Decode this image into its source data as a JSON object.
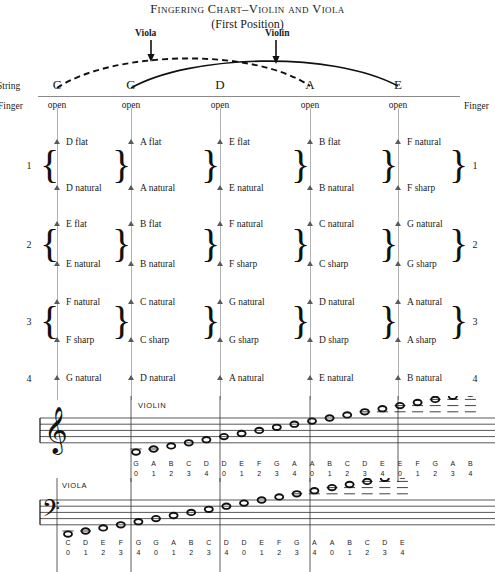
{
  "title": {
    "main": "Fingering Chart–Violin and Viola",
    "subtitle": "(First Position)"
  },
  "callouts": {
    "viola": "Viola",
    "violin": "Violin"
  },
  "side_labels": {
    "string_left": "String",
    "finger_left": "Finger",
    "finger_right": "Finger"
  },
  "strings": [
    {
      "name": "C",
      "open": "open",
      "x": 57
    },
    {
      "name": "G",
      "open": "open",
      "x": 131
    },
    {
      "name": "D",
      "open": "open",
      "x": 220
    },
    {
      "name": "A",
      "open": "open",
      "x": 310
    },
    {
      "name": "E",
      "open": "open",
      "x": 398
    }
  ],
  "finger_rows": [
    {
      "number": "1",
      "top": "D flat",
      "bottom": "D natural"
    },
    {
      "number": "2",
      "top": "E flat",
      "bottom": "E natural"
    },
    {
      "number": "3",
      "top": "F natural",
      "bottom": "F sharp"
    },
    {
      "number": "4",
      "top": "G natural",
      "bottom": ""
    }
  ],
  "fingerboard": {
    "rows": [
      {
        "finger": "1",
        "cells": [
          {
            "string": "C",
            "top": "D flat",
            "bottom": "D natural"
          },
          {
            "string": "G",
            "top": "A flat",
            "bottom": "A natural"
          },
          {
            "string": "D",
            "top": "E flat",
            "bottom": "E natural"
          },
          {
            "string": "A",
            "top": "B flat",
            "bottom": "B natural"
          },
          {
            "string": "E",
            "top": "F natural",
            "bottom": "F sharp"
          }
        ]
      },
      {
        "finger": "2",
        "cells": [
          {
            "string": "C",
            "top": "E flat",
            "bottom": "E natural"
          },
          {
            "string": "G",
            "top": "B flat",
            "bottom": "B natural"
          },
          {
            "string": "D",
            "top": "F natural",
            "bottom": "F sharp"
          },
          {
            "string": "A",
            "top": "C natural",
            "bottom": "C sharp"
          },
          {
            "string": "E",
            "top": "G natural",
            "bottom": "G sharp"
          }
        ]
      },
      {
        "finger": "3",
        "cells": [
          {
            "string": "C",
            "top": "F natural",
            "bottom": "F sharp"
          },
          {
            "string": "G",
            "top": "C natural",
            "bottom": "C sharp"
          },
          {
            "string": "D",
            "top": "G natural",
            "bottom": "G sharp"
          },
          {
            "string": "A",
            "top": "D natural",
            "bottom": "D sharp"
          },
          {
            "string": "E",
            "top": "A natural",
            "bottom": "A sharp"
          }
        ]
      },
      {
        "finger": "4",
        "cells": [
          {
            "string": "C",
            "top": "G natural",
            "bottom": ""
          },
          {
            "string": "G",
            "top": "D natural",
            "bottom": ""
          },
          {
            "string": "D",
            "top": "A natural",
            "bottom": ""
          },
          {
            "string": "A",
            "top": "E natural",
            "bottom": ""
          },
          {
            "string": "E",
            "top": "B natural",
            "bottom": ""
          }
        ]
      }
    ]
  },
  "staves": [
    {
      "instrument": "VIOLIN",
      "clef": "treble-clef",
      "groups": [
        {
          "string": "G",
          "notes": [
            {
              "pitch": "G",
              "finger": "0"
            },
            {
              "pitch": "A",
              "finger": "1"
            },
            {
              "pitch": "B",
              "finger": "2"
            },
            {
              "pitch": "C",
              "finger": "3"
            },
            {
              "pitch": "D",
              "finger": "4"
            }
          ]
        },
        {
          "string": "D",
          "notes": [
            {
              "pitch": "D",
              "finger": "0"
            },
            {
              "pitch": "E",
              "finger": "1"
            },
            {
              "pitch": "F",
              "finger": "2"
            },
            {
              "pitch": "G",
              "finger": "3"
            },
            {
              "pitch": "A",
              "finger": "4"
            }
          ]
        },
        {
          "string": "A",
          "notes": [
            {
              "pitch": "A",
              "finger": "0"
            },
            {
              "pitch": "B",
              "finger": "1"
            },
            {
              "pitch": "C",
              "finger": "2"
            },
            {
              "pitch": "D",
              "finger": "3"
            },
            {
              "pitch": "E",
              "finger": "4"
            }
          ]
        },
        {
          "string": "E",
          "notes": [
            {
              "pitch": "E",
              "finger": "0"
            },
            {
              "pitch": "F",
              "finger": "1"
            },
            {
              "pitch": "G",
              "finger": "2"
            },
            {
              "pitch": "A",
              "finger": "3"
            },
            {
              "pitch": "B",
              "finger": "4"
            }
          ]
        }
      ]
    },
    {
      "instrument": "VIOLA",
      "clef": "alto-clef",
      "groups": [
        {
          "string": "C",
          "notes": [
            {
              "pitch": "C",
              "finger": "0"
            },
            {
              "pitch": "D",
              "finger": "1"
            },
            {
              "pitch": "E",
              "finger": "2"
            },
            {
              "pitch": "F",
              "finger": "3"
            },
            {
              "pitch": "G",
              "finger": "4"
            }
          ]
        },
        {
          "string": "G",
          "notes": [
            {
              "pitch": "G",
              "finger": "0"
            },
            {
              "pitch": "A",
              "finger": "1"
            },
            {
              "pitch": "B",
              "finger": "2"
            },
            {
              "pitch": "C",
              "finger": "3"
            },
            {
              "pitch": "D",
              "finger": "4"
            }
          ]
        },
        {
          "string": "D",
          "notes": [
            {
              "pitch": "D",
              "finger": "0"
            },
            {
              "pitch": "E",
              "finger": "1"
            },
            {
              "pitch": "F",
              "finger": "2"
            },
            {
              "pitch": "G",
              "finger": "3"
            },
            {
              "pitch": "A",
              "finger": "4"
            }
          ]
        },
        {
          "string": "A",
          "notes": [
            {
              "pitch": "A",
              "finger": "0"
            },
            {
              "pitch": "B",
              "finger": "1"
            },
            {
              "pitch": "C",
              "finger": "2"
            },
            {
              "pitch": "D",
              "finger": "3"
            },
            {
              "pitch": "E",
              "finger": "4"
            }
          ]
        }
      ]
    }
  ],
  "colors": {
    "ink": "#1a1a1a",
    "string_line": "#b0b0b0",
    "rule": "#8a8a8a",
    "triangle": "#5a5a5a"
  }
}
